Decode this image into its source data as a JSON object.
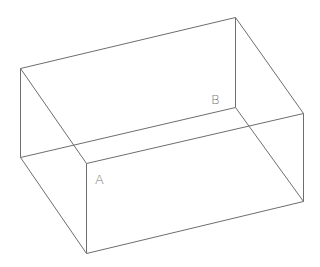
{
  "diagram": {
    "type": "wireframe-box",
    "stroke_color": "#6e6e6e",
    "background": "#ffffff",
    "vertices": {
      "back_top_left": [
        20,
        68
      ],
      "back_top_right": [
        235,
        17
      ],
      "back_bottom_left": [
        20,
        157
      ],
      "back_bottom_right": [
        235,
        107
      ],
      "front_top_left": [
        86,
        163
      ],
      "front_top_right": [
        303,
        113
      ],
      "front_bottom_left": [
        86,
        253
      ],
      "front_bottom_right": [
        303,
        201
      ]
    },
    "labels": [
      {
        "text": "A",
        "x": 95,
        "y": 184,
        "near_vertex": "front_top_left"
      },
      {
        "text": "B",
        "x": 211,
        "y": 104,
        "near_vertex": "back_bottom_right"
      }
    ]
  }
}
